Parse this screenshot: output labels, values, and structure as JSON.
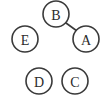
{
  "figure": {
    "type": "undirected-graph",
    "background_color": "#ffffff",
    "node_fill_color": "#ffffff",
    "node_stroke_color": "#3a3a3a",
    "node_label_color": "#2b2b2b",
    "edge_color": "#3a3a3a",
    "node_radius": 13,
    "node_stroke_width": 1.6,
    "edge_stroke_width": 1.6
  },
  "graph_data": {
    "nodes": [
      {
        "id": "B",
        "label": "B",
        "cx": 56,
        "cy": 14
      },
      {
        "id": "A",
        "label": "A",
        "cx": 86,
        "cy": 39
      },
      {
        "id": "E",
        "label": "E",
        "cx": 25,
        "cy": 39
      },
      {
        "id": "D",
        "label": "D",
        "cx": 39,
        "cy": 81
      },
      {
        "id": "C",
        "label": "C",
        "cx": 75,
        "cy": 81
      }
    ],
    "edges": [
      {
        "source": "B",
        "target": "A",
        "x1": 66,
        "y1": 23,
        "x2": 77,
        "y2": 31
      }
    ],
    "node_count": 5,
    "edge_count": 1
  }
}
